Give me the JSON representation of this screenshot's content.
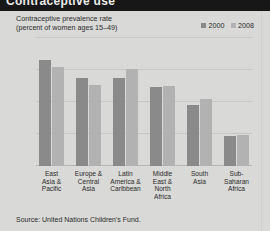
{
  "banner": {
    "headline": "Contraceptive use"
  },
  "subtitle_line1": "Contraceptive prevalence rate",
  "subtitle_line2": "(percent of women ages 15–49)",
  "source": "Source: United Nations Children's Fund.",
  "legend": {
    "items": [
      {
        "label": "2000",
        "color": "#8a8a8a"
      },
      {
        "label": "2008",
        "color": "#b2b2b2"
      }
    ]
  },
  "chart_data": {
    "type": "bar",
    "title": "Contraceptive prevalence rate",
    "subtitle": "(percent of women ages 15–49)",
    "xlabel": "",
    "ylabel": "",
    "ylim": [
      0,
      100
    ],
    "yticks": [
      100,
      75,
      50,
      25,
      0
    ],
    "grid": true,
    "legend_position": "top-right",
    "categories": [
      "East Asia & Pacific",
      "Europe & Central Asia",
      "Latin America & Caribbean",
      "Middle East & North Africa",
      "South Asia",
      "Sub-Saharan Africa"
    ],
    "category_lines": [
      [
        "East",
        "Asia &",
        "Pacific"
      ],
      [
        "Europe &",
        "Central",
        "Asia"
      ],
      [
        "Latin",
        "America &",
        "Caribbean"
      ],
      [
        "Middle",
        "East &",
        "North",
        "Africa"
      ],
      [
        "South",
        "Asia"
      ],
      [
        "Sub-",
        "Saharan",
        "Africa"
      ]
    ],
    "series": [
      {
        "name": "2000",
        "color": "#8a8a8a",
        "values": [
          82,
          68,
          68,
          61,
          47,
          23
        ]
      },
      {
        "name": "2008",
        "color": "#b2b2b2",
        "values": [
          77,
          63,
          75,
          62,
          52,
          24
        ]
      }
    ]
  }
}
